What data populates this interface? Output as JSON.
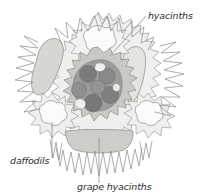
{
  "diagram": {
    "type": "garden-planting-plan",
    "title": "",
    "background_color": "#ffffff",
    "labels": [
      {
        "id": "hyacinths",
        "text": "hyacinths",
        "x": 148,
        "y": 19,
        "anchor": "start",
        "points_to": "upper-right-elongated-bulb-drift"
      },
      {
        "id": "daffodils",
        "text": "daffodils",
        "x": 10,
        "y": 164,
        "anchor": "start",
        "points_to": "left-daffodil-clump"
      },
      {
        "id": "grape-hyacinths",
        "text": "grape hyacinths",
        "x": 77,
        "y": 190,
        "anchor": "start",
        "points_to": "bottom-crescent-band"
      }
    ],
    "leader_lines": [
      {
        "id": "leader-hyacinths",
        "from_x": 146,
        "from_y": 16,
        "to_x": 110,
        "to_y": 56
      },
      {
        "id": "leader-daffodils",
        "from_x": 52,
        "from_y": 122,
        "to_x": 52,
        "to_y": 158
      },
      {
        "id": "leader-grape-hyacinths",
        "from_x": 99,
        "from_y": 138,
        "to_x": 99,
        "to_y": 183
      }
    ],
    "palette": {
      "outline": "#8a8a8a",
      "leader": "#8e8e8e",
      "text": "#2e2e2e",
      "pale_fill": "#f0f0ef",
      "light_gray_fill": "#dcdcda",
      "mid_gray_fill": "#c4c4c2",
      "dark_gray_fill": "#8f8f8f",
      "darkest_gray_fill": "#7b7b7b",
      "white_fill": "#fbfbfb"
    },
    "plant_groups": [
      {
        "id": "outer-spiky-mass",
        "name": "outer spiky foliage mass",
        "fill": "#efefed"
      },
      {
        "id": "upper-left-elongated-bulb-drift",
        "name": "upper left elongated drift",
        "fill": "#d6d6d3"
      },
      {
        "id": "upper-right-elongated-bulb-drift",
        "name": "upper right elongated drift",
        "fill": "#e3e3e0"
      },
      {
        "id": "top-daffodil-clump",
        "name": "top daffodil clump",
        "fill": "#f7f7f6"
      },
      {
        "id": "left-daffodil-clump",
        "name": "left daffodil clump",
        "fill": "#fbfbfb"
      },
      {
        "id": "right-daffodil-clump",
        "name": "right daffodil clump",
        "fill": "#fbfbfb"
      },
      {
        "id": "center-ring",
        "name": "central spiky ring",
        "fill": "#c9c9c6"
      },
      {
        "id": "center-core",
        "name": "central grape hyacinth core",
        "fill": "#9c9c9a"
      },
      {
        "id": "bottom-crescent-band",
        "name": "bottom crescent band",
        "fill": "#cdcdca"
      }
    ],
    "grape_hyacinth_bulbs": [
      {
        "cx": 88,
        "cy": 74,
        "r": 8.5,
        "fill": "#7b7b7b"
      },
      {
        "cx": 107,
        "cy": 76,
        "r": 8.0,
        "fill": "#8a8a8a"
      },
      {
        "cx": 110,
        "cy": 95,
        "r": 8.5,
        "fill": "#7f7f7f"
      },
      {
        "cx": 93,
        "cy": 103,
        "r": 9.0,
        "fill": "#787878"
      },
      {
        "cx": 79,
        "cy": 90,
        "r": 7.5,
        "fill": "#8f8f8f"
      },
      {
        "cx": 98,
        "cy": 87,
        "r": 7.0,
        "fill": "#949494"
      }
    ]
  }
}
